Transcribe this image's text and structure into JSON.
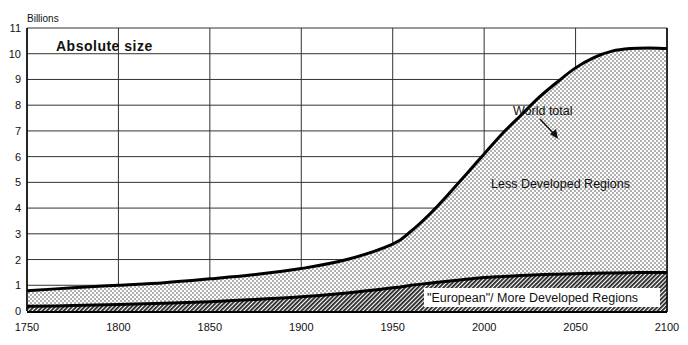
{
  "chart_data": {
    "type": "area",
    "title": "Absolute size",
    "xlabel": "",
    "ylabel": "Billions",
    "xlim": [
      1750,
      2100
    ],
    "ylim": [
      0,
      11
    ],
    "grid": true,
    "x_ticks": [
      1750,
      1800,
      1850,
      1900,
      1950,
      2000,
      2050,
      2100
    ],
    "y_ticks": [
      0,
      1,
      2,
      3,
      4,
      5,
      6,
      7,
      8,
      9,
      10,
      11
    ],
    "x": [
      1750,
      1775,
      1800,
      1825,
      1850,
      1875,
      1900,
      1925,
      1950,
      1960,
      1970,
      1980,
      1990,
      2000,
      2010,
      2020,
      2030,
      2040,
      2050,
      2060,
      2070,
      2080,
      2090,
      2100
    ],
    "series": [
      {
        "name": "World total",
        "values": [
          0.79,
          0.9,
          1.0,
          1.1,
          1.25,
          1.42,
          1.65,
          2.0,
          2.6,
          3.1,
          3.75,
          4.5,
          5.3,
          6.1,
          6.9,
          7.6,
          8.3,
          8.9,
          9.45,
          9.85,
          10.1,
          10.2,
          10.22,
          10.2
        ]
      },
      {
        "name": "\"European\"/ More Developed Regions",
        "values": [
          0.18,
          0.21,
          0.25,
          0.3,
          0.36,
          0.45,
          0.55,
          0.7,
          0.9,
          1.0,
          1.08,
          1.16,
          1.23,
          1.3,
          1.34,
          1.38,
          1.41,
          1.43,
          1.45,
          1.47,
          1.48,
          1.49,
          1.5,
          1.5
        ]
      }
    ],
    "regions": [
      {
        "name": "Less Developed Regions",
        "pattern": "dots",
        "between": [
          "\"European\"/ More Developed Regions",
          "World total"
        ]
      },
      {
        "name": "\"European\"/ More Developed Regions",
        "pattern": "diagonal-hatch",
        "between": [
          "baseline",
          "\"European\"/ More Developed Regions"
        ]
      }
    ],
    "annotations": [
      {
        "text": "World total",
        "arrow_to_year": 2008
      },
      {
        "text": "Less Developed Regions"
      },
      {
        "text": "\"European\"/ More Developed Regions"
      }
    ]
  },
  "labels": {
    "units": "Billions",
    "title": "Absolute size",
    "world_total": "World total",
    "less_developed": "Less Developed Regions",
    "more_developed": "\"European\"/ More Developed Regions"
  }
}
